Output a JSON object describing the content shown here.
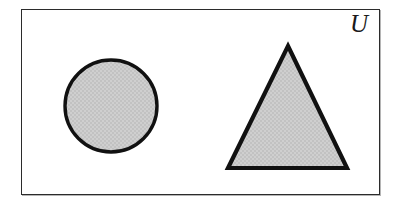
{
  "figure": {
    "kind": "set-diagram",
    "caption_label": "U",
    "background_color": "#ffffff"
  },
  "universe": {
    "label": "U",
    "border_color": "#2b2b2b",
    "fill_color": "#ffffff",
    "x": 21,
    "y": 9,
    "width": 359,
    "height": 186
  },
  "shapes": [
    {
      "name": "circle",
      "label": "",
      "fill_color": "#cccccc",
      "stroke_color": "#111111",
      "stroke_width": 3.4,
      "cx": 111,
      "cy": 106,
      "r": 46
    },
    {
      "name": "triangle",
      "label": "",
      "fill_color": "#cccccc",
      "stroke_color": "#111111",
      "stroke_width": 4.2,
      "points": "288,46 347,168 228,168"
    }
  ]
}
